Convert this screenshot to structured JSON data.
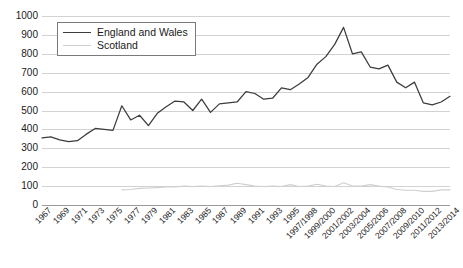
{
  "chart_data": {
    "type": "line",
    "title": "",
    "subtitle": "",
    "xlabel": "",
    "ylabel": "",
    "ylim": [
      0,
      1000
    ],
    "ytick_step": 100,
    "yticks": [
      0,
      100,
      200,
      300,
      400,
      500,
      600,
      700,
      800,
      900,
      1000
    ],
    "grid": true,
    "legend_position": "top-left",
    "colors": {
      "england_and_wales": "#3c3c3c",
      "scotland": "#cfcfcf",
      "gridline": "#d2d2d2",
      "axis": "#9a9a9a",
      "text": "#1a1a1a",
      "background": "#ffffff"
    },
    "x": [
      "1967",
      "1968",
      "1969",
      "1970",
      "1971",
      "1972",
      "1973",
      "1974",
      "1975",
      "1976",
      "1977",
      "1978",
      "1979",
      "1980",
      "1981",
      "1982",
      "1983",
      "1984",
      "1985",
      "1986",
      "1987",
      "1988",
      "1989",
      "1990",
      "1991",
      "1992",
      "1993",
      "1994",
      "1995",
      "1996",
      "1997/1998",
      "1998/1999",
      "1999/2000",
      "2000/2001",
      "2001/2002",
      "2002/2003",
      "2003/2004",
      "2004/2005",
      "2005/2006",
      "2006/2007",
      "2007/2008",
      "2008/2009",
      "2009/2010",
      "2010/2011",
      "2011/2012",
      "2012/2013",
      "2013/2014"
    ],
    "xtick_labels": [
      "1967",
      "1969",
      "1971",
      "1973",
      "1975",
      "1977",
      "1979",
      "1981",
      "1983",
      "1985",
      "1987",
      "1989",
      "1991",
      "1993",
      "1995",
      "1997/1998",
      "1999/2000",
      "2001/2002",
      "2003/2004",
      "2005/2006",
      "2007/2008",
      "2009/2010",
      "2011/2012",
      "2013/2014"
    ],
    "series": [
      {
        "name": "England and Wales",
        "color": "#3c3c3c",
        "values": [
          355,
          360,
          345,
          335,
          340,
          375,
          405,
          400,
          395,
          525,
          450,
          475,
          420,
          485,
          520,
          550,
          545,
          500,
          560,
          490,
          535,
          540,
          545,
          600,
          590,
          560,
          565,
          620,
          610,
          640,
          675,
          745,
          785,
          850,
          940,
          800,
          810,
          730,
          720,
          740,
          650,
          620,
          650,
          540,
          530,
          545,
          575
        ]
      },
      {
        "name": "Scotland",
        "color": "#cfcfcf",
        "values": [
          null,
          null,
          null,
          null,
          null,
          null,
          null,
          null,
          null,
          80,
          82,
          88,
          90,
          92,
          95,
          95,
          100,
          98,
          100,
          98,
          102,
          105,
          115,
          108,
          100,
          98,
          100,
          98,
          108,
          98,
          100,
          110,
          100,
          98,
          118,
          100,
          100,
          108,
          100,
          95,
          82,
          78,
          78,
          72,
          72,
          80,
          80
        ]
      }
    ]
  },
  "legend": {
    "items": [
      {
        "label": "England and Wales",
        "color": "#3c3c3c"
      },
      {
        "label": "Scotland",
        "color": "#cfcfcf"
      }
    ]
  }
}
